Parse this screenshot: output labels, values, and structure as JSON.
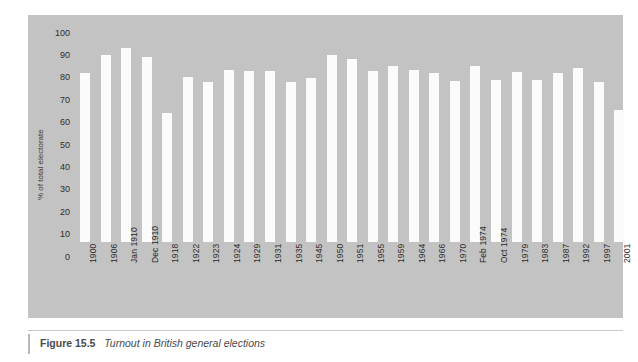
{
  "figure": {
    "caption_number": "Figure 15.5",
    "caption_title": "Turnout in British general elections"
  },
  "colors": {
    "page_background": "#ffffff",
    "plot_background": "#c3c3c3",
    "bar_fill": "#fbfbfb",
    "tick_text": "#2b2b2b",
    "caption_text": "#4a4a4a"
  },
  "chart_data": {
    "type": "bar",
    "title": "Turnout in British general elections",
    "xlabel": "",
    "ylabel": "% of total electorate",
    "ylim": [
      0,
      100
    ],
    "yticks": [
      0,
      10,
      20,
      30,
      40,
      50,
      60,
      70,
      80,
      90,
      100
    ],
    "ytick_labels": [
      "0",
      "10",
      "20",
      "30",
      "40",
      "50",
      "60",
      "70",
      "80",
      "90",
      "100"
    ],
    "grid": false,
    "legend": false,
    "categories": [
      "1900",
      "1906",
      "Jan 1910",
      "Dec 1910",
      "1918",
      "1922",
      "1923",
      "1924",
      "1929",
      "1931",
      "1935",
      "1945",
      "1950",
      "1951",
      "1955",
      "1959",
      "1964",
      "1966",
      "1970",
      "Feb 1974",
      "Oct 1974",
      "1979",
      "1983",
      "1987",
      "1992",
      "1997",
      "2001"
    ],
    "values": [
      75.5,
      83.5,
      86.5,
      82.5,
      57.5,
      73.5,
      71.5,
      77.0,
      76.5,
      76.5,
      71.5,
      73.0,
      83.5,
      81.5,
      76.5,
      78.5,
      77.0,
      75.5,
      72.0,
      78.5,
      72.5,
      76.0,
      72.5,
      75.5,
      77.5,
      71.5,
      59.0
    ]
  }
}
